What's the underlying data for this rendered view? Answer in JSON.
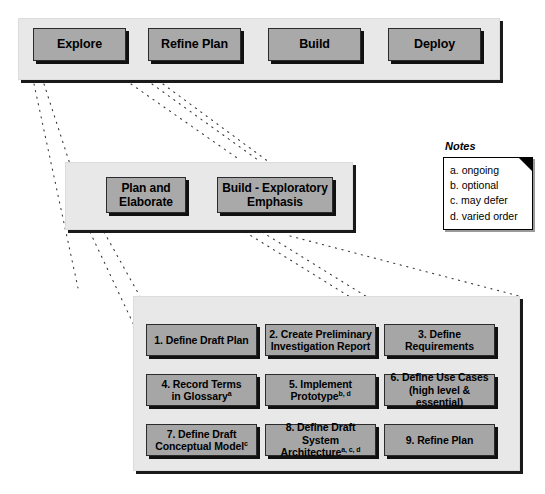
{
  "phases": {
    "band_label": "phase-band",
    "items": [
      {
        "label": "Explore"
      },
      {
        "label": "Refine Plan"
      },
      {
        "label": "Build"
      },
      {
        "label": "Deploy"
      }
    ]
  },
  "stages": {
    "band_label": "stage-band",
    "items": [
      {
        "label": "Plan and\nElaborate"
      },
      {
        "label": "Build - Exploratory\nEmphasis"
      }
    ]
  },
  "activities": {
    "band_label": "activity-band",
    "items": [
      {
        "number": "1.",
        "line1": "1. Define Draft Plan",
        "line2": "",
        "sup": "",
        "align": "center"
      },
      {
        "number": "2.",
        "line1": "2. Create Preliminary",
        "line2": "Investigation Report",
        "sup": "",
        "align": "center"
      },
      {
        "number": "3.",
        "line1": "3. Define Requirements",
        "line2": "",
        "sup": "",
        "align": "center"
      },
      {
        "number": "4.",
        "line1": "4. Record Terms",
        "line2": "in Glossary",
        "sup": "a",
        "align": "center"
      },
      {
        "number": "5.",
        "line1": "5. Implement",
        "line2": "Prototype",
        "sup": "b, d",
        "align": "center"
      },
      {
        "number": "6.",
        "line1": "6. Define Use Cases",
        "line2": "(high level & essential)",
        "sup": "",
        "align": "center"
      },
      {
        "number": "7.",
        "line1": "7. Define Draft",
        "line2": "Conceptual Model",
        "sup": "c",
        "align": "center"
      },
      {
        "number": "8.",
        "line1": "8. Define Draft System",
        "line2": "Architecture",
        "sup": "a, c, d",
        "align": "center"
      },
      {
        "number": "9.",
        "line1": "9. Refine Plan",
        "line2": "",
        "sup": "",
        "align": "center"
      }
    ]
  },
  "notes": {
    "title": "Notes",
    "items": [
      "a. ongoing",
      "b. optional",
      "c. may defer",
      "d. varied order"
    ]
  },
  "colors": {
    "node_fill": "#a9a9a9",
    "band_fill": "#e8e8e8",
    "shadow": "#111111",
    "text": "#000000",
    "page_bg": "#ffffff"
  }
}
